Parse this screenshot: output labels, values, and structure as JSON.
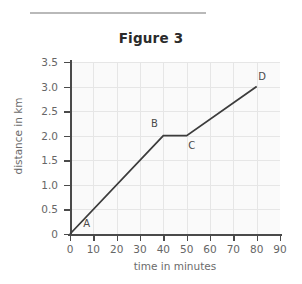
{
  "figure": {
    "title": "Figure 3",
    "rule_visible": true
  },
  "chart_data": {
    "type": "line",
    "title": "Figure 3",
    "xlabel": "time in minutes",
    "ylabel": "distance in km",
    "xlim": [
      0,
      90
    ],
    "ylim": [
      0,
      3.5
    ],
    "grid": true,
    "legend": null,
    "x_ticks": [
      "0",
      "10",
      "20",
      "30",
      "40",
      "50",
      "60",
      "70",
      "80",
      "90"
    ],
    "x_tick_values": [
      0,
      10,
      20,
      30,
      40,
      50,
      60,
      70,
      80,
      90
    ],
    "y_ticks": [
      "0",
      "0.5",
      "1.0",
      "1.5",
      "2.0",
      "2.5",
      "3.0",
      "3.5"
    ],
    "y_tick_values": [
      0,
      0.5,
      1.0,
      1.5,
      2.0,
      2.5,
      3.0,
      3.5
    ],
    "series": [
      {
        "name": "journey",
        "x": [
          0,
          40,
          50,
          80
        ],
        "values": [
          0,
          2.0,
          2.0,
          3.0
        ],
        "color": "#3c3c3c"
      }
    ],
    "annotations": [
      {
        "label": "A",
        "x": 7,
        "y": 0.18,
        "anchor": "right-of-line"
      },
      {
        "label": "B",
        "x": 36,
        "y": 2.22,
        "anchor": "above-left"
      },
      {
        "label": "C",
        "x": 52,
        "y": 1.78,
        "anchor": "below-right"
      },
      {
        "label": "D",
        "x": 82,
        "y": 3.18,
        "anchor": "above-right"
      }
    ]
  },
  "colors": {
    "line": "#3c3c3c",
    "axis": "#4a4a4a",
    "grid": "#e6e6e6",
    "plot_bg": "#fafafa",
    "page_bg": "#ffffff",
    "tick_text": "#666666",
    "title_text": "#2b2b2b",
    "rule": "#b9b9b9"
  }
}
